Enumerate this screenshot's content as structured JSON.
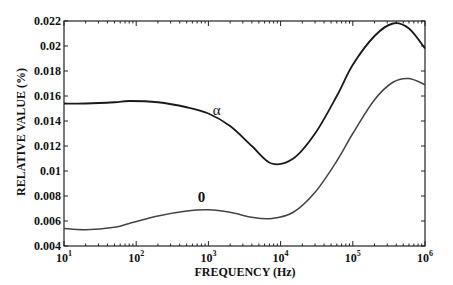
{
  "chart_data": {
    "type": "line",
    "title": "",
    "xlabel": "FREQUENCY (Hz)",
    "ylabel": "RELATIVE VALUE (%)",
    "xscale": "log",
    "xlim": [
      10,
      1000000
    ],
    "ylim": [
      0.004,
      0.022
    ],
    "grid": false,
    "legend": "none (inline curve labels)",
    "x_ticks": [
      "10^1",
      "10^2",
      "10^3",
      "10^4",
      "10^5",
      "10^6"
    ],
    "y_ticks": [
      "0.004",
      "0.006",
      "0.008",
      "0.01",
      "0.012",
      "0.014",
      "0.016",
      "0.018",
      "0.02",
      "0.022"
    ],
    "x": [
      10,
      20,
      50,
      80,
      200,
      500,
      1000,
      2000,
      4000,
      7500,
      15000,
      30000,
      60000,
      100000,
      200000,
      360000,
      600000,
      1000000
    ],
    "series": [
      {
        "name": "α",
        "label_position": {
          "x": 1300,
          "y": 0.0145
        },
        "color": "#1a1a1a",
        "values": [
          0.0154,
          0.0154,
          0.0155,
          0.0156,
          0.0155,
          0.0151,
          0.0146,
          0.0136,
          0.012,
          0.0106,
          0.011,
          0.013,
          0.016,
          0.0185,
          0.0208,
          0.0218,
          0.0214,
          0.0198
        ]
      },
      {
        "name": "0",
        "label_position": {
          "x": 800,
          "y": 0.0075
        },
        "color": "#444444",
        "values": [
          0.0054,
          0.0053,
          0.0055,
          0.0058,
          0.0064,
          0.0068,
          0.0069,
          0.0067,
          0.0063,
          0.0062,
          0.0067,
          0.0083,
          0.0108,
          0.013,
          0.0157,
          0.0171,
          0.0174,
          0.0169
        ]
      }
    ]
  }
}
